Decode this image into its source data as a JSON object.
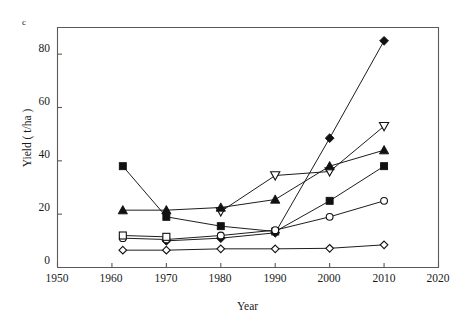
{
  "panel": {
    "label": "c"
  },
  "chart_data": {
    "type": "line",
    "title": "",
    "subtitle": "",
    "xlabel": "Year",
    "ylabel": "Yield ( t/ha )",
    "xlim": [
      1950,
      2020
    ],
    "ylim": [
      0,
      90
    ],
    "xticks": [
      1950,
      1960,
      1970,
      1980,
      1990,
      2000,
      2010,
      2020
    ],
    "yticks": [
      0,
      20,
      40,
      60,
      80
    ],
    "xtick_labels": [
      "1950",
      "1960",
      "1970",
      "1980",
      "1990",
      "2000",
      "2010",
      "2020"
    ],
    "ytick_labels": [
      "0",
      "20",
      "40",
      "60",
      "80"
    ],
    "grid": false,
    "legend": "none",
    "legend_position": "none",
    "x": [
      1962,
      1970,
      1980,
      1990,
      2000,
      2010
    ],
    "series": [
      {
        "name": "filled-diamond",
        "marker": "filled-diamond",
        "color": "#111111",
        "values": [
          null,
          10.0,
          11.0,
          13.0,
          48.5,
          85.0
        ]
      },
      {
        "name": "open-down-triangle",
        "marker": "open-down-triangle",
        "color": "#111111",
        "values": [
          null,
          null,
          21.0,
          34.5,
          36.0,
          53.0
        ]
      },
      {
        "name": "filled-triangle",
        "marker": "filled-triangle",
        "color": "#111111",
        "values": [
          21.5,
          21.5,
          22.5,
          25.5,
          38.0,
          44.0
        ]
      },
      {
        "name": "filled-square",
        "marker": "filled-square",
        "color": "#111111",
        "values": [
          38.0,
          19.0,
          15.5,
          13.5,
          25.0,
          38.0
        ]
      },
      {
        "name": "open-circle",
        "marker": "open-circle",
        "color": "#111111",
        "values": [
          11.0,
          10.5,
          12.0,
          14.0,
          19.0,
          25.0
        ]
      },
      {
        "name": "open-square",
        "marker": "open-square",
        "color": "#111111",
        "values": [
          12.0,
          11.5,
          null,
          null,
          null,
          null
        ]
      },
      {
        "name": "open-diamond",
        "marker": "open-diamond",
        "color": "#111111",
        "values": [
          6.5,
          6.5,
          7.0,
          7.0,
          7.2,
          8.5
        ]
      }
    ],
    "annotations": [
      {
        "text": "c",
        "role": "panel-label"
      }
    ]
  }
}
